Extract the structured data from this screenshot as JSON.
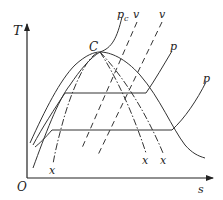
{
  "diagram": {
    "type": "T-s diagram",
    "axes": {
      "y_label": "T",
      "x_label": "s",
      "origin_label": "O"
    },
    "labels": {
      "critical_point": "C",
      "critical_pressure": "p",
      "critical_pressure_sub": "c",
      "volume_1": "v",
      "volume_2": "v",
      "pressure_1": "p",
      "pressure_2": "p",
      "quality_left": "x",
      "quality_mid": "x",
      "quality_right": "x"
    },
    "curves": [
      {
        "name": "saturation-dome",
        "style": "solid"
      },
      {
        "name": "critical-isobar",
        "style": "solid"
      },
      {
        "name": "isobar-high",
        "style": "solid"
      },
      {
        "name": "isobar-low",
        "style": "solid"
      },
      {
        "name": "isochore-1",
        "style": "dashed"
      },
      {
        "name": "isochore-2",
        "style": "dashed"
      },
      {
        "name": "quality-line-left",
        "style": "dash-dot"
      },
      {
        "name": "quality-line-mid",
        "style": "dash-dot"
      },
      {
        "name": "quality-line-right",
        "style": "dash-dot"
      }
    ],
    "colors": {
      "line": "#333333",
      "background": "#ffffff"
    }
  }
}
